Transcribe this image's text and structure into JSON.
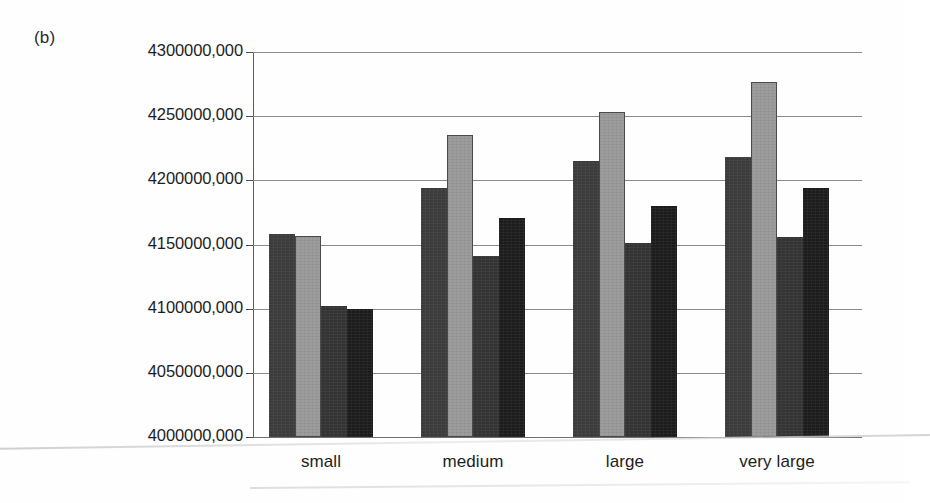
{
  "figure": {
    "panel_label": "(b)"
  },
  "chart_data": {
    "type": "bar",
    "title": "",
    "subtitle": "",
    "xlabel": "",
    "ylabel": "",
    "grid": true,
    "legend": "none",
    "orientation": "vertical",
    "grouping": "clustered",
    "categories": [
      "small",
      "medium",
      "large",
      "very large"
    ],
    "ylim": [
      4000000000,
      4300000000
    ],
    "ytick_step": 50000000,
    "ytick_labels": [
      "4300000,000",
      "4250000,000",
      "4200000,000",
      "4150000,000",
      "4100000,000",
      "4050000,000",
      "4000000,000"
    ],
    "ytick_values": [
      4300000000,
      4250000000,
      4200000000,
      4150000000,
      4100000000,
      4050000000,
      4000000000
    ],
    "series": [
      {
        "name": "series-1",
        "color": "#3b3b3b",
        "values": [
          4158000000,
          4194000000,
          4215000000,
          4218000000
        ]
      },
      {
        "name": "series-2",
        "color": "#9d9d9d",
        "values": [
          4156500000,
          4235500000,
          4253000000,
          4277000000
        ]
      },
      {
        "name": "series-3",
        "color": "#333333",
        "values": [
          4102000000,
          4141000000,
          4151000000,
          4156000000
        ]
      },
      {
        "name": "series-4",
        "color": "#1c1c1c",
        "values": [
          4100000000,
          4171000000,
          4180000000,
          4194000000
        ]
      }
    ]
  }
}
